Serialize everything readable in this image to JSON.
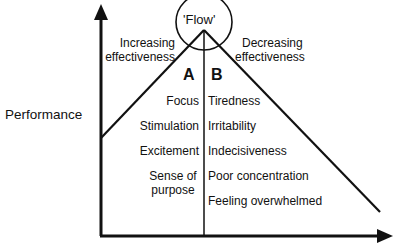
{
  "diagram": {
    "y_axis_label": "Performance",
    "x_axis_label_clipped": "",
    "peak_label": "'Flow'",
    "left_region": {
      "heading_line1": "Increasing",
      "heading_line2": "effectiveness",
      "zone_letter": "A",
      "items": [
        "Focus",
        "Stimulation",
        "Excitement",
        "Sense of",
        "purpose"
      ]
    },
    "right_region": {
      "heading_line1": "Decreasing",
      "heading_line2": "effectiveness",
      "zone_letter": "B",
      "items": [
        "Tiredness",
        "Irritability",
        "Indecisiveness",
        "Poor concentration",
        "Feeling overwhelmed"
      ]
    },
    "colors": {
      "line": "#111111",
      "background": "#ffffff"
    }
  }
}
